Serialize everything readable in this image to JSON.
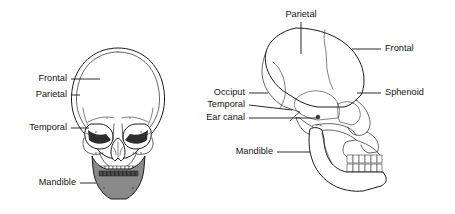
{
  "figure": {
    "background_color": "#ffffff",
    "line_color": "#1c1c1c",
    "label_color": "#141414",
    "mandible_shade_color": "#8a8a8a",
    "views": [
      {
        "id": "anterior",
        "name": "Anterior skull view",
        "labels": [
          {
            "id": "frontal",
            "text": "Frontal"
          },
          {
            "id": "parietal",
            "text": "Parietal"
          },
          {
            "id": "temporal",
            "text": "Temporal"
          },
          {
            "id": "mandible",
            "text": "Mandible"
          }
        ]
      },
      {
        "id": "lateral",
        "name": "Lateral skull view",
        "labels": [
          {
            "id": "parietal",
            "text": "Parietal"
          },
          {
            "id": "frontal",
            "text": "Frontal"
          },
          {
            "id": "occiput",
            "text": "Occiput"
          },
          {
            "id": "sphenoid",
            "text": "Sphenoid"
          },
          {
            "id": "temporal",
            "text": "Temporal"
          },
          {
            "id": "ear_canal",
            "text": "Ear canal"
          },
          {
            "id": "mandible",
            "text": "Mandible"
          }
        ]
      }
    ]
  }
}
